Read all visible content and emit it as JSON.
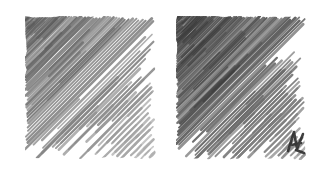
{
  "artwork": {
    "title": "Pencil Hatching Gradient Study",
    "medium": "graphite-pencil-hatching",
    "background_color": "#ffffff",
    "canvas": {
      "width": 326,
      "height": 175
    }
  },
  "panels": [
    {
      "id": "left-panel",
      "name": "left-hatching-square",
      "label": "Left hatching square",
      "x": 25,
      "y": 16,
      "width": 131,
      "height": 143,
      "stroke_angle_deg": 45,
      "stroke_direction": "lower-left-to-upper-right",
      "tone_darkest_corner": "top-left",
      "tone_lightest_corner": "bottom-right",
      "darkest_color": "#5a5a5a",
      "midtone_color": "#7d7d7d",
      "lightest_color": "#b4b4b4",
      "stroke_count": 150,
      "density": "medium",
      "seed": 1701,
      "has_accent_mark": false
    },
    {
      "id": "right-panel",
      "name": "right-hatching-square",
      "label": "Right hatching square",
      "x": 176,
      "y": 16,
      "width": 130,
      "height": 144,
      "stroke_angle_deg": 45,
      "stroke_direction": "lower-left-to-upper-right",
      "tone_darkest_corner": "top-left",
      "tone_lightest_corner": "bottom-right",
      "darkest_color": "#3a3a3a",
      "midtone_color": "#5e5e5e",
      "lightest_color": "#989898",
      "stroke_count": 172,
      "density": "high",
      "seed": 9317,
      "has_accent_mark": true,
      "accent_mark": {
        "name": "corner-squiggle-mark",
        "x": 112,
        "y": 116,
        "color": "#2c2c2c"
      }
    }
  ]
}
